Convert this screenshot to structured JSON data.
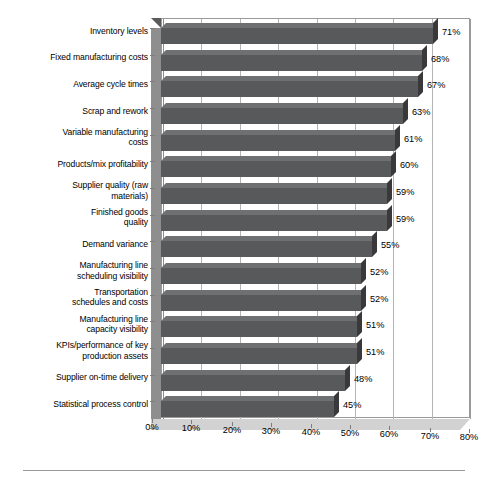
{
  "chart_data": {
    "type": "bar",
    "orientation": "horizontal",
    "title": "",
    "subtitle": "",
    "xlabel": "",
    "ylabel": "",
    "xlim": [
      0,
      80
    ],
    "xtick_step": 10,
    "xticks": [
      "0%",
      "10%",
      "20%",
      "30%",
      "40%",
      "50%",
      "60%",
      "70%",
      "80%"
    ],
    "xtick_values": [
      0,
      10,
      20,
      30,
      40,
      50,
      60,
      70,
      80
    ],
    "grid": "vertical",
    "legend": "none",
    "value_suffix": "%",
    "categories": [
      "Inventory levels",
      "Fixed manufacturing costs",
      "Average cycle times",
      "Scrap and rework",
      "Variable manufacturing\ncosts",
      "Products/mix profitability",
      "Supplier quality (raw\nmaterials)",
      "Finished goods\nquality",
      "Demand variance",
      "Manufacturing line\nscheduling visibility",
      "Transportation\nschedules and costs",
      "Manufacturing line\ncapacity visibility",
      "KPIs/performance of key\nproduction assets",
      "Supplier on-time delivery",
      "Statistical process control"
    ],
    "values": [
      71,
      68,
      67,
      63,
      61,
      60,
      59,
      59,
      55,
      52,
      52,
      51,
      51,
      48,
      45
    ],
    "data_labels": [
      "71%",
      "68%",
      "67%",
      "63%",
      "61%",
      "60%",
      "59%",
      "59%",
      "55%",
      "52%",
      "52%",
      "51%",
      "51%",
      "48%",
      "45%"
    ],
    "colors": {
      "bar_fill": "#58595b",
      "bar_top": "#6f7072",
      "bar_cap": "#39393b",
      "plot_background": "#ffffff",
      "grid_line": "#b4b4b4",
      "axis_line": "#8e8e8e",
      "wall": "#8e8e8e",
      "floor": "#d2d2d2",
      "text": "#000000"
    }
  }
}
